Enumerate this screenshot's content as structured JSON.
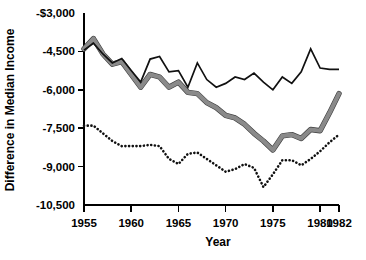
{
  "chart_data": {
    "type": "line",
    "title": "",
    "xlabel": "Year",
    "ylabel": "Difference in Median Income",
    "xlim": [
      1955,
      1982
    ],
    "ylim": [
      -10500,
      -3000
    ],
    "grid": false,
    "legend": "none",
    "x_tick_labels": [
      "1955",
      "1960",
      "1965",
      "1970",
      "1975",
      "1980",
      "1982"
    ],
    "x_ticks": [
      1955,
      1960,
      1965,
      1970,
      1975,
      1980,
      1982
    ],
    "y_tick_labels": [
      "-$3,000",
      "-4,500",
      "-6,000",
      "-7,500",
      "-9,000",
      "-10,500"
    ],
    "y_ticks": [
      -3000,
      -4500,
      -6000,
      -7500,
      -9000,
      -10500
    ],
    "x": [
      1955,
      1956,
      1957,
      1958,
      1959,
      1960,
      1961,
      1962,
      1963,
      1964,
      1965,
      1966,
      1967,
      1968,
      1969,
      1970,
      1971,
      1972,
      1973,
      1974,
      1975,
      1976,
      1977,
      1978,
      1979,
      1980,
      1981,
      1982
    ],
    "series": [
      {
        "name": "series-solid-black",
        "style": "solid-thin",
        "color": "#111111",
        "values": [
          -4450,
          -4180,
          -4600,
          -4950,
          -4780,
          -5250,
          -5700,
          -4800,
          -4700,
          -5300,
          -5250,
          -5900,
          -4950,
          -5600,
          -5900,
          -5750,
          -5500,
          -5600,
          -5350,
          -5700,
          -6000,
          -5500,
          -5750,
          -5300,
          -4400,
          -5150,
          -5200,
          -5200
        ]
      },
      {
        "name": "series-thick-gray",
        "style": "thick",
        "color": "#8a8a8a",
        "values": [
          -4400,
          -4000,
          -4600,
          -5000,
          -4900,
          -5400,
          -5900,
          -5400,
          -5500,
          -5900,
          -5700,
          -6100,
          -6150,
          -6500,
          -6700,
          -7000,
          -7100,
          -7350,
          -7700,
          -8000,
          -8350,
          -7800,
          -7750,
          -7900,
          -7550,
          -7600,
          -6900,
          -6150
        ]
      },
      {
        "name": "series-dotted",
        "style": "dotted",
        "color": "#111111",
        "values": [
          -7400,
          -7400,
          -7700,
          -8000,
          -8200,
          -8200,
          -8200,
          -8150,
          -8200,
          -8700,
          -8900,
          -8500,
          -8450,
          -8700,
          -8950,
          -9200,
          -9100,
          -8900,
          -9050,
          -9800,
          -9300,
          -8750,
          -8750,
          -8950,
          -8700,
          -8400,
          -8050,
          -7750
        ]
      }
    ]
  },
  "axis": {
    "y_title": "Difference in Median Income",
    "x_title": "Year"
  }
}
